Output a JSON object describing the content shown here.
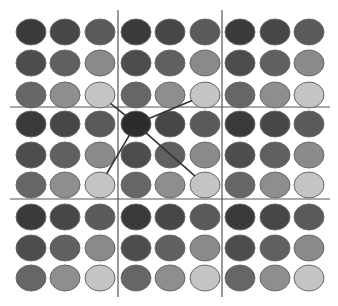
{
  "diagram": {
    "canvas": {
      "width": 338,
      "height": 306,
      "background": "#ffffff"
    },
    "grid_lines": {
      "color": "#555555",
      "vertical": [
        {
          "x": 118,
          "y1": 10,
          "y2": 297
        },
        {
          "x": 222,
          "y1": 10,
          "y2": 297
        }
      ],
      "horizontal": [
        {
          "y": 107,
          "x1": 10,
          "x2": 330
        },
        {
          "y": 199,
          "x1": 10,
          "x2": 330
        }
      ]
    },
    "dot": {
      "rx": 15,
      "ry": 13,
      "stroke": "#6a6a6a"
    },
    "column_x": [
      31,
      65,
      100,
      136,
      170,
      205,
      240,
      275,
      309
    ],
    "row_y": [
      32,
      63,
      95,
      124,
      155,
      185,
      217,
      248,
      278
    ],
    "block_shades": [
      [
        "#3a3a3a",
        "#474747",
        "#5a5a5a"
      ],
      [
        "#4d4d4d",
        "#606060",
        "#8a8a8a"
      ],
      [
        "#666666",
        "#8e8e8e",
        "#c4c4c4"
      ]
    ],
    "highlight": {
      "row": 3,
      "col": 3,
      "fill": "#2c2c2c"
    },
    "connections": {
      "color": "#333333",
      "from": {
        "row": 3,
        "col": 3
      },
      "to": [
        {
          "row": 2,
          "col": 2
        },
        {
          "row": 2,
          "col": 5
        },
        {
          "row": 5,
          "col": 2
        },
        {
          "row": 5,
          "col": 5
        }
      ]
    }
  }
}
